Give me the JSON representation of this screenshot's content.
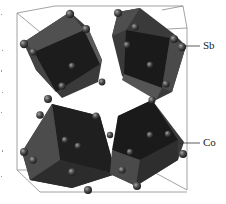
{
  "figure": {
    "structure": "cubic unit cell with four tilted CoSb6 octahedra",
    "labels": [
      {
        "id": "sb",
        "text": "Sb",
        "x": 203,
        "y": 40,
        "leader": {
          "x1": 186,
          "y1": 46,
          "x2": 200,
          "y2": 46
        }
      },
      {
        "id": "co",
        "text": "Co",
        "x": 203,
        "y": 137,
        "leader": {
          "x1": 178,
          "y1": 143,
          "x2": 200,
          "y2": 143
        }
      }
    ],
    "colors": {
      "background": "#ffffff",
      "cell_edge": "#8a8a8a",
      "octahedron_dark": "#1c1c1c",
      "octahedron_mid": "#3a3a3a",
      "octahedron_light": "#5a5a5a",
      "atom": "#4a4a4a",
      "atom_highlight": "#9a9a9a",
      "void": "#ffffff",
      "text": "#222222"
    },
    "octahedra": [
      {
        "name": "top-left",
        "cx": 72,
        "cy": 62
      },
      {
        "name": "top-right",
        "cx": 150,
        "cy": 58
      },
      {
        "name": "bottom-left",
        "cx": 72,
        "cy": 145
      },
      {
        "name": "bottom-right",
        "cx": 150,
        "cy": 145
      }
    ]
  }
}
